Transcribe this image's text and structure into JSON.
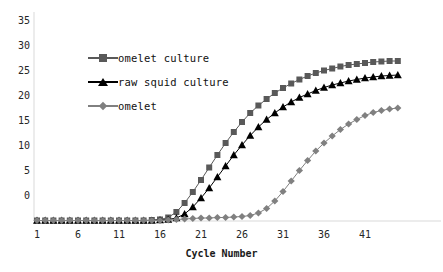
{
  "chart_data": {
    "type": "line",
    "title": "",
    "xlabel": "Cycle Number",
    "ylabel": "",
    "xlim": [
      1,
      45
    ],
    "ylim": [
      0,
      35
    ],
    "grid": false,
    "legend_position": "upper-left-inside",
    "xticks": [
      1,
      6,
      11,
      16,
      21,
      26,
      31,
      36,
      41
    ],
    "yticks": [
      0,
      5,
      10,
      15,
      20,
      25,
      30,
      35
    ],
    "x": [
      1,
      2,
      3,
      4,
      5,
      6,
      7,
      8,
      9,
      10,
      11,
      12,
      13,
      14,
      15,
      16,
      17,
      18,
      19,
      20,
      21,
      22,
      23,
      24,
      25,
      26,
      27,
      28,
      29,
      30,
      31,
      32,
      33,
      34,
      35,
      36,
      37,
      38,
      39,
      40,
      41,
      42,
      43,
      44,
      45
    ],
    "series": [
      {
        "name": "omelet culture",
        "marker": "square",
        "color": "#595959",
        "values": [
          0.1,
          0.1,
          0.1,
          0.1,
          0.1,
          0.1,
          0.1,
          0.1,
          0.1,
          0.1,
          0.1,
          0.1,
          0.1,
          0.1,
          0.2,
          0.3,
          0.7,
          1.8,
          3.6,
          5.8,
          8.2,
          10.7,
          13.2,
          15.6,
          17.8,
          19.8,
          21.6,
          23.1,
          24.4,
          25.6,
          26.6,
          27.5,
          28.3,
          29.0,
          29.6,
          30.1,
          30.5,
          30.9,
          31.2,
          31.4,
          31.6,
          31.8,
          31.9,
          32.0,
          32.0
        ]
      },
      {
        "name": "raw squid culture",
        "marker": "triangle",
        "color": "#000000",
        "values": [
          0.1,
          0.1,
          0.1,
          0.1,
          0.1,
          0.1,
          0.1,
          0.1,
          0.1,
          0.1,
          0.1,
          0.1,
          0.1,
          0.1,
          0.1,
          0.2,
          0.3,
          0.6,
          1.4,
          2.8,
          4.6,
          6.6,
          8.8,
          11.0,
          13.2,
          15.2,
          17.1,
          18.8,
          20.3,
          21.6,
          22.8,
          23.8,
          24.7,
          25.4,
          26.1,
          26.7,
          27.2,
          27.6,
          28.0,
          28.3,
          28.6,
          28.8,
          29.0,
          29.1,
          29.2
        ]
      },
      {
        "name": "omelet",
        "marker": "diamond",
        "color": "#808080",
        "values": [
          0.1,
          0.1,
          0.1,
          0.1,
          0.1,
          0.1,
          0.1,
          0.1,
          0.1,
          0.1,
          0.1,
          0.1,
          0.1,
          0.1,
          0.1,
          0.1,
          0.2,
          0.3,
          0.4,
          0.5,
          0.6,
          0.6,
          0.7,
          0.7,
          0.8,
          0.9,
          1.1,
          1.6,
          2.5,
          4.0,
          5.9,
          8.0,
          10.1,
          12.1,
          14.0,
          15.6,
          17.0,
          18.3,
          19.4,
          20.3,
          21.1,
          21.7,
          22.1,
          22.4,
          22.6
        ]
      }
    ]
  },
  "axis": {
    "x_title": "Cycle Number",
    "x_tick_labels": [
      "1",
      "6",
      "11",
      "16",
      "21",
      "26",
      "31",
      "36",
      "41"
    ],
    "y_tick_labels": [
      "0",
      "5",
      "10",
      "15",
      "20",
      "25",
      "30",
      "35"
    ]
  },
  "legend": {
    "entries": [
      {
        "label": "omelet culture",
        "marker": "square-marker",
        "color": "#595959"
      },
      {
        "label": "raw squid culture",
        "marker": "triangle-marker",
        "color": "#000000"
      },
      {
        "label": "omelet",
        "marker": "diamond-marker",
        "color": "#808080"
      }
    ]
  },
  "colors": {
    "axis": "#d9d9d9",
    "text": "#1a1a1a",
    "background": "#ffffff"
  }
}
